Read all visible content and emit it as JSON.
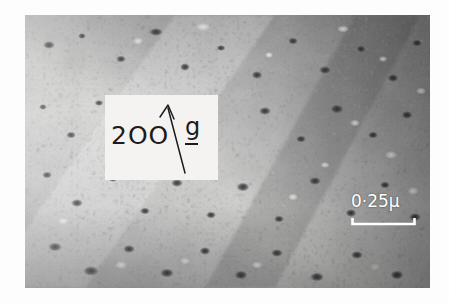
{
  "figure": {
    "kind": "transmission-electron-micrograph",
    "background_color": "#fdfdfd",
    "plate": {
      "x": 25,
      "y": 15,
      "width": 405,
      "height": 273,
      "description": "grayscale TEM bright-field image of a thin foil showing a dense dispersion of small dark dislocation loops / defect clusters on a mottled grey background with a lighter diagonal band running from lower-left to upper-right and darker contrast along the right and bottom edges",
      "tone_range": {
        "darkest": "#141414",
        "mid": "#8d8d8d",
        "lightest": "#fbfbfb"
      }
    }
  },
  "annotation_box": {
    "x": 105,
    "y": 95,
    "width": 113,
    "height": 85,
    "background_color": "#f4f3f1",
    "reflection_index": "2OO",
    "vector_symbol": "g",
    "vector_underlined": true,
    "arrow": {
      "name": "diffraction-vector-arrow",
      "direction": "up-left",
      "tail_x": 175,
      "tail_y": 172,
      "head_x": 168,
      "head_y": 103
    },
    "ink_color": "#1c1c1c"
  },
  "scale_bar": {
    "label": "0·25μ",
    "value": 0.25,
    "unit": "μ",
    "color": "#ffffff",
    "x": 351,
    "y": 217,
    "bar_length_px": 65,
    "tick_style": "upward-end-ticks"
  }
}
